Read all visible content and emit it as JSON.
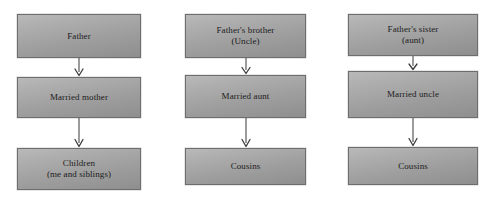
{
  "diagram": {
    "style": {
      "box_fill_light": "#b9b9b9",
      "box_fill_dark": "#8e8e8e",
      "box_border": "#6e6e6e",
      "text_color": "#1c1c1c",
      "arrow_color": "#4a4a4a",
      "background": "#ffffff"
    },
    "columns": [
      {
        "id": "paternal-direct",
        "nodes": [
          {
            "id": "father",
            "label": "Father"
          },
          {
            "id": "married-mother",
            "label": "Married mother"
          },
          {
            "id": "children",
            "label": "Children\n(me and siblings)"
          }
        ],
        "connectors": [
          {
            "id": "father-to-mother",
            "type": "arrow-down"
          },
          {
            "id": "mother-to-children",
            "type": "arrow-down"
          }
        ]
      },
      {
        "id": "fathers-brother",
        "nodes": [
          {
            "id": "fathers-brother",
            "label": "Father's brother\n(Uncle)"
          },
          {
            "id": "married-aunt",
            "label": "Married aunt"
          },
          {
            "id": "cousins-uncle-side",
            "label": "Cousins"
          }
        ],
        "connectors": [
          {
            "id": "uncle-to-aunt",
            "type": "arrow-down"
          },
          {
            "id": "aunt-to-cousins",
            "type": "arrow-down"
          }
        ]
      },
      {
        "id": "fathers-sister",
        "nodes": [
          {
            "id": "fathers-sister",
            "label": "Father's sister\n(aunt)"
          },
          {
            "id": "married-uncle",
            "label": "Married uncle"
          },
          {
            "id": "cousins-aunt-side",
            "label": "Cousins"
          }
        ],
        "connectors": [
          {
            "id": "aunt-to-uncle",
            "type": "arrow-down"
          },
          {
            "id": "uncle-to-cousins",
            "type": "arrow-down"
          }
        ]
      }
    ]
  }
}
